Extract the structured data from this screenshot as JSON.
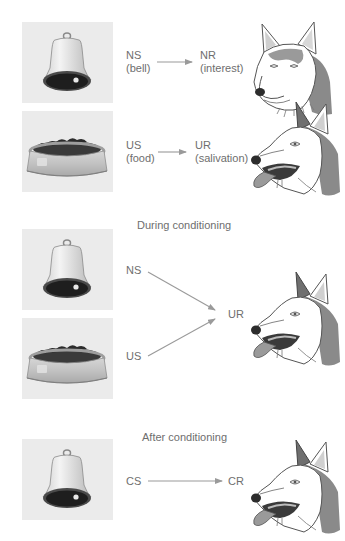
{
  "sections": {
    "before": {
      "rows": [
        {
          "stimulus_icon": "bell-icon",
          "stimulus_label": "NS",
          "stimulus_sub": "(bell)",
          "response_label": "NR",
          "response_sub": "(interest)",
          "dog_icon": "dog-head-neutral-icon"
        },
        {
          "stimulus_icon": "food-bowl-icon",
          "bowl_text": "FOOD",
          "stimulus_label": "US",
          "stimulus_sub": "(food)",
          "response_label": "UR",
          "response_sub": "(salivation)",
          "dog_icon": "dog-head-salivating-icon"
        }
      ]
    },
    "during": {
      "title": "During conditioning",
      "inputs": [
        {
          "label": "NS",
          "icon": "bell-icon"
        },
        {
          "label": "US",
          "icon": "food-bowl-icon",
          "bowl_text": "FOOD"
        }
      ],
      "response_label": "UR",
      "dog_icon": "dog-head-salivating-icon"
    },
    "after": {
      "title": "After conditioning",
      "stimulus_label": "CS",
      "stimulus_icon": "bell-icon",
      "response_label": "CR",
      "dog_icon": "dog-head-salivating-icon"
    }
  },
  "colors": {
    "panel_bg": "#ebebeb",
    "arrow": "#9a9a9a",
    "text": "#6e6e6e",
    "dog_fur_dark": "#7a7a7a"
  }
}
